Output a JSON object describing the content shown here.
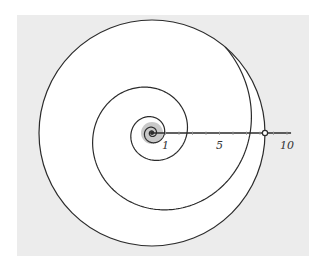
{
  "figure": {
    "colors": {
      "background_panel": "#ececec",
      "disc_fill": "#ffffff",
      "stroke": "#2b2b2b",
      "core_shade": "#c9c9c9",
      "marker_fill": "#ffffff"
    },
    "center": [
      152,
      133
    ],
    "circle_radius": 113,
    "spiral": {
      "a": 35,
      "b": 0.164,
      "t_start": -18.8,
      "t_end": 7.15
    },
    "core_shade_radius": 11,
    "axis": {
      "origin_x": 152,
      "unit_px": 13.5,
      "end_value": 10.3,
      "tick_values": [
        1,
        2,
        3,
        4,
        5,
        6,
        7,
        8,
        9,
        10
      ],
      "labels": [
        {
          "value": 1,
          "text": "1"
        },
        {
          "value": 5,
          "text": "5"
        },
        {
          "value": 10,
          "text": "10"
        }
      ],
      "marker_value": 8.37
    }
  }
}
